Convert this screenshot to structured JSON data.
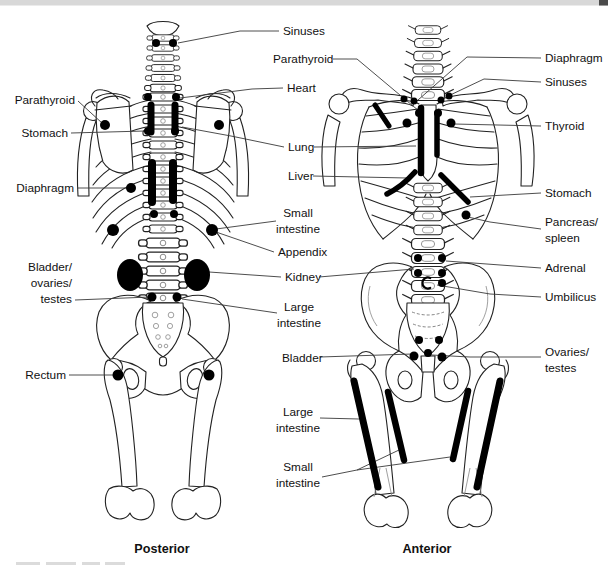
{
  "page": {
    "background": "#ffffff",
    "top_strip_color": "#d8d8d8",
    "corner_mark_color": "#4a4a4a",
    "bone_line_color": "#222222",
    "mark_color": "#000000",
    "leader_color": "#3a3a3a",
    "text_color": "#111111"
  },
  "captions": {
    "posterior": "Posterior",
    "anterior": "Anterior"
  },
  "labels": [
    {
      "id": "sinuses-center",
      "text": [
        "Sinuses"
      ],
      "x": 283,
      "y": 35,
      "align": "start",
      "leaders": [
        [
          [
            279,
            31
          ],
          [
            240,
            31
          ],
          [
            178,
            43
          ]
        ]
      ]
    },
    {
      "id": "parathyroid-center",
      "text": [
        "Parathyroid"
      ],
      "x": 273,
      "y": 63,
      "align": "start",
      "leaders": [
        [
          [
            333,
            59
          ],
          [
            357,
            59
          ],
          [
            419,
            111
          ]
        ]
      ]
    },
    {
      "id": "heart-center",
      "text": [
        "Heart"
      ],
      "x": 287,
      "y": 92,
      "align": "start",
      "leaders": [
        [
          [
            283,
            88
          ],
          [
            252,
            89
          ],
          [
            180,
            98
          ]
        ]
      ]
    },
    {
      "id": "lung-center",
      "text": [
        "Lung"
      ],
      "x": 288,
      "y": 151,
      "align": "start",
      "leaders": [
        [
          [
            284,
            147
          ],
          [
            231,
            136
          ],
          [
            182,
            127
          ]
        ],
        [
          [
            314,
            147
          ],
          [
            416,
            146
          ]
        ]
      ]
    },
    {
      "id": "liver-center",
      "text": [
        "Liver"
      ],
      "x": 288,
      "y": 180,
      "align": "start",
      "leaders": [
        [
          [
            313,
            176
          ],
          [
            407,
            178
          ]
        ]
      ]
    },
    {
      "id": "small-intestine-center",
      "text": [
        "Small",
        "intestine"
      ],
      "x": 298,
      "y": 217,
      "align": "middle",
      "leaders": [
        [
          [
            276,
            221
          ],
          [
            216,
            229
          ]
        ]
      ]
    },
    {
      "id": "appendix-center",
      "text": [
        "Appendix"
      ],
      "x": 278,
      "y": 256,
      "align": "start",
      "leaders": [
        [
          [
            274,
            252
          ],
          [
            216,
            232
          ]
        ]
      ]
    },
    {
      "id": "kidney-center",
      "text": [
        "Kidney"
      ],
      "x": 285,
      "y": 281,
      "align": "start",
      "leaders": [
        [
          [
            281,
            277
          ],
          [
            209,
            272
          ]
        ],
        [
          [
            319,
            277
          ],
          [
            414,
            269
          ]
        ]
      ]
    },
    {
      "id": "large-intestine-center",
      "text": [
        "Large",
        "intestine"
      ],
      "x": 299,
      "y": 311,
      "align": "middle",
      "leaders": [
        [
          [
            277,
            313
          ],
          [
            182,
            299
          ]
        ]
      ]
    },
    {
      "id": "bladder-center",
      "text": [
        "Bladder"
      ],
      "x": 282,
      "y": 362,
      "align": "start",
      "leaders": [
        [
          [
            320,
            357
          ],
          [
            412,
            354
          ]
        ]
      ]
    },
    {
      "id": "large-intestine-lower",
      "text": [
        "Large",
        "intestine"
      ],
      "x": 298,
      "y": 416,
      "align": "middle",
      "leaders": [
        [
          [
            320,
            418
          ],
          [
            359,
            419
          ]
        ]
      ]
    },
    {
      "id": "small-intestine-lower",
      "text": [
        "Small",
        "intestine"
      ],
      "x": 298,
      "y": 471,
      "align": "middle",
      "leaders": [
        [
          [
            322,
            477
          ],
          [
            357,
            470
          ],
          [
            399,
            450
          ]
        ],
        [
          [
            357,
            470
          ],
          [
            450,
            457
          ]
        ]
      ]
    },
    {
      "id": "parathyroid-left",
      "text": [
        "Parathyroid"
      ],
      "x": 75,
      "y": 104,
      "align": "end",
      "leaders": [
        [
          [
            78,
            101
          ],
          [
            102,
            123
          ]
        ]
      ]
    },
    {
      "id": "stomach-left",
      "text": [
        "Stomach"
      ],
      "x": 68,
      "y": 137,
      "align": "end",
      "leaders": [
        [
          [
            71,
            133
          ],
          [
            145,
            131
          ]
        ]
      ]
    },
    {
      "id": "diaphragm-left",
      "text": [
        "Diaphragm"
      ],
      "x": 74,
      "y": 192,
      "align": "end",
      "leaders": [
        [
          [
            77,
            188
          ],
          [
            127,
            188
          ]
        ]
      ]
    },
    {
      "id": "bladder-ovaries-testes-left",
      "text": [
        "Bladder/",
        "ovaries/",
        "testes"
      ],
      "x": 72,
      "y": 271,
      "align": "end",
      "leaders": [
        [
          [
            75,
            300
          ],
          [
            150,
            297
          ]
        ]
      ]
    },
    {
      "id": "rectum-left",
      "text": [
        "Rectum"
      ],
      "x": 66,
      "y": 379,
      "align": "end",
      "leaders": [
        [
          [
            69,
            375
          ],
          [
            113,
            375
          ]
        ]
      ]
    },
    {
      "id": "diaphragm-right",
      "text": [
        "Diaphragm"
      ],
      "x": 545,
      "y": 62,
      "align": "start",
      "leaders": [
        [
          [
            541,
            58
          ],
          [
            467,
            57
          ],
          [
            418,
            100
          ]
        ]
      ]
    },
    {
      "id": "sinuses-right",
      "text": [
        "Sinuses"
      ],
      "x": 545,
      "y": 86,
      "align": "start",
      "leaders": [
        [
          [
            541,
            82
          ],
          [
            484,
            79
          ],
          [
            446,
            97
          ]
        ]
      ]
    },
    {
      "id": "thyroid-right",
      "text": [
        "Thyroid"
      ],
      "x": 545,
      "y": 130,
      "align": "start",
      "leaders": [
        [
          [
            541,
            126
          ],
          [
            454,
            124
          ]
        ]
      ]
    },
    {
      "id": "stomach-right",
      "text": [
        "Stomach"
      ],
      "x": 545,
      "y": 197,
      "align": "start",
      "leaders": [
        [
          [
            541,
            193
          ],
          [
            470,
            197
          ]
        ]
      ]
    },
    {
      "id": "pancreas-spleen-right",
      "text": [
        "Pancreas/",
        "spleen"
      ],
      "x": 545,
      "y": 226,
      "align": "start",
      "leaders": [
        [
          [
            541,
            229
          ],
          [
            490,
            222
          ],
          [
            468,
            217
          ]
        ]
      ]
    },
    {
      "id": "adrenal-right",
      "text": [
        "Adrenal"
      ],
      "x": 545,
      "y": 272,
      "align": "start",
      "leaders": [
        [
          [
            541,
            268
          ],
          [
            446,
            261
          ]
        ]
      ]
    },
    {
      "id": "umbilicus-right",
      "text": [
        "Umbilicus"
      ],
      "x": 545,
      "y": 301,
      "align": "start",
      "leaders": [
        [
          [
            541,
            297
          ],
          [
            490,
            294
          ],
          [
            437,
            285
          ]
        ]
      ]
    },
    {
      "id": "ovaries-testes-right",
      "text": [
        "Ovaries/",
        "testes"
      ],
      "x": 545,
      "y": 356,
      "align": "start",
      "leaders": [
        [
          [
            541,
            357
          ],
          [
            470,
            357
          ],
          [
            432,
            355
          ]
        ]
      ]
    }
  ],
  "marks": {
    "posterior": {
      "dots": [
        [
          156,
          43,
          4
        ],
        [
          173,
          43,
          4
        ],
        [
          148,
          97,
          4
        ],
        [
          176,
          97,
          4
        ],
        [
          105,
          125,
          5
        ],
        [
          219,
          125,
          5
        ],
        [
          148,
          131,
          4
        ],
        [
          175,
          131,
          4
        ],
        [
          131,
          188,
          5
        ],
        [
          154,
          214,
          4
        ],
        [
          174,
          214,
          4
        ],
        [
          113,
          230,
          6
        ],
        [
          212,
          230,
          6
        ],
        [
          152,
          297,
          4.5
        ],
        [
          177,
          297,
          4.5
        ],
        [
          118,
          375,
          5.5
        ],
        [
          209,
          375,
          5.5
        ]
      ],
      "bars": [
        [
          151,
          105,
          151,
          132,
          7
        ],
        [
          175,
          105,
          175,
          132,
          7
        ],
        [
          152,
          163,
          152,
          202,
          8
        ],
        [
          173,
          163,
          173,
          200,
          8
        ]
      ],
      "ellipses": [
        [
          130,
          275,
          13,
          16
        ],
        [
          197,
          275,
          13,
          16
        ]
      ]
    },
    "anterior": {
      "dots": [
        [
          404,
          99,
          3.5
        ],
        [
          414,
          101,
          3.5
        ],
        [
          441,
          100,
          3.5
        ],
        [
          449,
          96,
          3.5
        ],
        [
          419,
          113,
          4
        ],
        [
          438,
          113,
          4
        ],
        [
          407,
          123,
          4.5
        ],
        [
          451,
          123,
          4.5
        ],
        [
          466,
          215,
          4.5
        ],
        [
          418,
          258,
          4
        ],
        [
          442,
          258,
          4
        ],
        [
          418,
          273,
          4
        ],
        [
          442,
          273,
          4
        ],
        [
          442,
          283,
          4
        ],
        [
          419,
          340,
          4
        ],
        [
          439,
          340,
          4
        ],
        [
          414,
          356,
          4.5
        ],
        [
          428,
          353,
          4
        ],
        [
          442,
          357,
          4.5
        ]
      ],
      "bars": [
        [
          375,
          105,
          389,
          126,
          5
        ],
        [
          421,
          108,
          421,
          173,
          6.5
        ],
        [
          437,
          113,
          437,
          155,
          5.5
        ],
        [
          354,
          381,
          378,
          487,
          7
        ],
        [
          388,
          392,
          404,
          460,
          6.5
        ],
        [
          468,
          391,
          453,
          459,
          6.5
        ],
        [
          500,
          381,
          477,
          487,
          7
        ]
      ],
      "strokes": [
        {
          "d": "M415,172 C407,181 397,189 387,194",
          "w": 5.5
        },
        {
          "d": "M441,175 C450,184 460,194 468,202",
          "w": 5.5
        }
      ],
      "umbilicus_arc": {
        "cx": 428,
        "cy": 283,
        "r": 5.5
      }
    }
  }
}
